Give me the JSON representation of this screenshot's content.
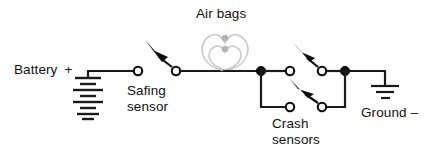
{
  "diagram": {
    "title": "Air bags",
    "type": "schematic",
    "background_color": "#ffffff",
    "line_color": "#1a1a1a",
    "airbag_color": "#c8c8c8",
    "labels": {
      "battery": "Battery",
      "battery_polarity": "+",
      "safing_sensor_line1": "Safing",
      "safing_sensor_line2": "sensor",
      "airbags": "Air bags",
      "crash_sensors_line1": "Crash",
      "crash_sensors_line2": "sensors",
      "ground": "Ground –"
    },
    "components": {
      "battery": {
        "name": "battery",
        "cell_pairs": 4,
        "x": 88
      },
      "safing_sensor": {
        "name": "safing-sensor",
        "state": "open",
        "terminals": 2
      },
      "airbags": {
        "name": "air-bags",
        "count": 2
      },
      "crash_sensors": {
        "name": "crash-sensors",
        "count": 2,
        "state": "open",
        "wiring": "parallel"
      },
      "ground": {
        "name": "ground",
        "bars": 3,
        "x": 385
      }
    }
  }
}
